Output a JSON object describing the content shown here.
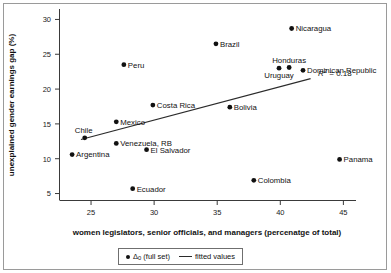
{
  "chart_data": {
    "type": "scatter",
    "title": "",
    "xlabel": "women legislators, senior officials, and managers (percenatge of total)",
    "ylabel": "unexplained gender earnings gap (%)",
    "xlim": [
      22.5,
      46.0
    ],
    "ylim": [
      4.0,
      31.5
    ],
    "xticks": [
      25,
      30,
      35,
      40,
      45
    ],
    "yticks": [
      5,
      10,
      15,
      20,
      25,
      30
    ],
    "grid": false,
    "annotations": [
      {
        "text": "R2 = 0.18",
        "x": 43.0,
        "y": 21.0
      }
    ],
    "legend_position": "bottom-center",
    "series": [
      {
        "name": "Δ0 (full set)",
        "type": "scatter",
        "points": [
          {
            "label": "Argentina",
            "x": 23.5,
            "y": 10.6,
            "label_pos": "right"
          },
          {
            "label": "Chile",
            "x": 24.5,
            "y": 13.0,
            "label_pos": "above-left"
          },
          {
            "label": "Mexico",
            "x": 27.0,
            "y": 15.3,
            "label_pos": "right"
          },
          {
            "label": "Venezuela, RB",
            "x": 27.0,
            "y": 12.2,
            "label_pos": "right"
          },
          {
            "label": "Peru",
            "x": 27.6,
            "y": 23.5,
            "label_pos": "right"
          },
          {
            "label": "Ecuador",
            "x": 28.3,
            "y": 5.7,
            "label_pos": "right"
          },
          {
            "label": "El Salvador",
            "x": 29.4,
            "y": 11.3,
            "label_pos": "right"
          },
          {
            "label": "Costa Rica",
            "x": 29.9,
            "y": 17.7,
            "label_pos": "right"
          },
          {
            "label": "Brazil",
            "x": 34.9,
            "y": 26.5,
            "label_pos": "right"
          },
          {
            "label": "Bolivia",
            "x": 36.0,
            "y": 17.4,
            "label_pos": "right"
          },
          {
            "label": "Colombia",
            "x": 37.9,
            "y": 6.9,
            "label_pos": "right"
          },
          {
            "label": "Uruguay",
            "x": 39.9,
            "y": 23.0,
            "label_pos": "below"
          },
          {
            "label": "Honduras",
            "x": 40.7,
            "y": 23.1,
            "label_pos": "above"
          },
          {
            "label": "Nicaragua",
            "x": 40.9,
            "y": 28.7,
            "label_pos": "right"
          },
          {
            "label": "Dominican Republic",
            "x": 41.8,
            "y": 22.7,
            "label_pos": "right"
          },
          {
            "label": "Panama",
            "x": 44.7,
            "y": 9.9,
            "label_pos": "right"
          }
        ]
      },
      {
        "name": "fitted values",
        "type": "line",
        "x": [
          24.2,
          42.4
        ],
        "y": [
          12.75,
          21.5
        ]
      }
    ]
  },
  "axes": {
    "x_title": "women legislators, senior officials, and managers (percenatge of total)",
    "y_title": "unexplained gender earnings gap (%)",
    "x_tick_labels": [
      "25",
      "30",
      "35",
      "40",
      "45"
    ],
    "y_tick_labels": [
      "5",
      "10",
      "15",
      "20",
      "25",
      "30"
    ]
  },
  "legend": {
    "scatter_label_main": "Δ",
    "scatter_label_sub": "0",
    "scatter_label_rest": " (full set)",
    "line_label": "fitted values"
  },
  "r2": {
    "r_italic": "R",
    "superscript": "2",
    "value": " = 0.18"
  },
  "colors": {
    "marker": "#111111",
    "fit_line": "#2b2b2b",
    "axis": "#3a3a3a",
    "frame": "#9a9a9a",
    "background": "#ffffff"
  }
}
